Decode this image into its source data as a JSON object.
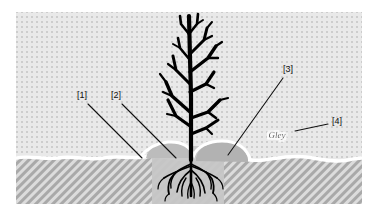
{
  "figure": {
    "background_color": "#ffffff",
    "frame": {
      "x": 16,
      "y": 12,
      "width": 346,
      "height": 192
    }
  },
  "layers": {
    "upper": {
      "name": "stippled-upper-layer",
      "pattern": "dotted",
      "base_color": "#e8e8e8",
      "dot_color": "#cfcfcf"
    },
    "lower": {
      "name": "hatched-lower-layer",
      "pattern": "diagonal-hatch",
      "base_color": "#d8d8d8",
      "hatch_color": "#a8a8a8"
    },
    "boundary": {
      "name": "wavy-surface-line",
      "color": "#ffffff",
      "width": 3
    }
  },
  "features": {
    "root_zone": {
      "name": "root-zone-block",
      "color": "#c9c9c9"
    },
    "mound_left": {
      "name": "left-mound",
      "color": "#bdbdbd"
    },
    "mound_right": {
      "name": "right-mound",
      "color": "#b5b5b5"
    },
    "plant": {
      "name": "bare-shrub-silhouette",
      "color": "#000000"
    },
    "roots": {
      "name": "root-system",
      "color": "#000000"
    }
  },
  "callouts": [
    {
      "id": "1",
      "label": "[1]",
      "label_x": 82,
      "label_y": 96,
      "line": {
        "x1": 88,
        "y1": 104,
        "x2": 142,
        "y2": 158
      }
    },
    {
      "id": "2",
      "label": "[2]",
      "label_x": 116,
      "label_y": 96,
      "line": {
        "x1": 122,
        "y1": 104,
        "x2": 176,
        "y2": 158
      }
    },
    {
      "id": "3",
      "label": "[3]",
      "label_x": 285,
      "label_y": 70,
      "line": {
        "x1": 283,
        "y1": 78,
        "x2": 228,
        "y2": 155
      }
    },
    {
      "id": "4",
      "label": "[4]",
      "label_x": 332,
      "label_y": 122,
      "line": {
        "x1": 328,
        "y1": 124,
        "x2": 295,
        "y2": 131
      }
    }
  ],
  "annotations": {
    "gley": {
      "text": "Gley",
      "x": 277,
      "y": 136,
      "halo_color": "#ffffff"
    }
  }
}
